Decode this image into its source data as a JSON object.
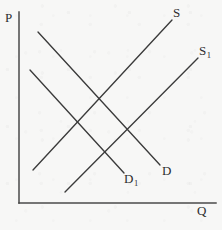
{
  "figure": {
    "kind": "supply-demand-diagram",
    "background_color": "#f7f7f6",
    "line_color": "#3b3b3b",
    "axis_color": "#4a4a4a",
    "width": 222,
    "height": 230
  },
  "axes": {
    "vertical": {
      "label": "P",
      "label_x": 5,
      "label_y": 11,
      "x": 19,
      "y_top": 12,
      "y_bottom": 203
    },
    "horizontal": {
      "label": "Q",
      "label_x": 197,
      "label_y": 204,
      "y": 203,
      "x_left": 19,
      "x_right": 216
    }
  },
  "curves": [
    {
      "id": "demand",
      "label": "D",
      "label_html": "D",
      "type": "demand",
      "x1": 38,
      "y1": 32,
      "x2": 160,
      "y2": 165,
      "label_x": 162,
      "label_y": 164
    },
    {
      "id": "demand-shifted",
      "label": "D1",
      "label_html": "D<sub>1</sub>",
      "type": "demand",
      "x1": 30,
      "y1": 70,
      "x2": 124,
      "y2": 173,
      "label_x": 124,
      "label_y": 172
    },
    {
      "id": "supply",
      "label": "S",
      "label_html": "S",
      "type": "supply",
      "x1": 33,
      "y1": 170,
      "x2": 172,
      "y2": 20,
      "label_x": 173,
      "label_y": 6
    },
    {
      "id": "supply-shifted",
      "label": "S1",
      "label_html": "S<sub>1</sub>",
      "type": "supply",
      "x1": 65,
      "y1": 192,
      "x2": 198,
      "y2": 58,
      "label_x": 199,
      "label_y": 44
    }
  ],
  "chart_data": {
    "type": "line",
    "title": "",
    "xlabel": "Q",
    "ylabel": "P",
    "grid": false,
    "legend": "none",
    "series": [
      {
        "name": "D",
        "role": "demand",
        "points": [
          [
            38,
            32
          ],
          [
            160,
            165
          ]
        ]
      },
      {
        "name": "D1",
        "role": "demand",
        "points": [
          [
            30,
            70
          ],
          [
            124,
            173
          ]
        ]
      },
      {
        "name": "S",
        "role": "supply",
        "points": [
          [
            33,
            170
          ],
          [
            172,
            20
          ]
        ]
      },
      {
        "name": "S1",
        "role": "supply",
        "points": [
          [
            65,
            192
          ],
          [
            198,
            58
          ]
        ]
      }
    ],
    "axis_ranges": {
      "x": [
        19,
        216
      ],
      "y": [
        12,
        203
      ]
    }
  }
}
